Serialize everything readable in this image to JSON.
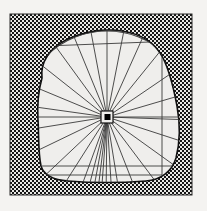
{
  "figure": {
    "title": "Radial survey plan of an irregular excavation area",
    "type": "archaeological-plan-diagram",
    "style": "line-drawing",
    "colors": {
      "page_background": "#f4f3f1",
      "interior_fill": "#efeeec",
      "hatch_ink": "#1a1a1a",
      "hatch_background": "#e8e7e4",
      "line_ink": "#3a3a3a",
      "outline_ink": "#111111",
      "hub_fill": "#000000"
    },
    "frame": {
      "outer_hatch_band": {
        "x": 10,
        "y": 14,
        "width": 182,
        "height": 181
      },
      "inner_rectangle": {
        "x": 21,
        "y": 30,
        "width": 141,
        "height": 145
      },
      "hatch_band_thickness": 12
    },
    "hub": {
      "label": "survey-station",
      "cx": 107,
      "cy": 117,
      "outer_square_size": 11,
      "inner_square_size": 6
    },
    "arc": {
      "label": "reference-arc",
      "radius": 86,
      "start_angle_deg": 182,
      "end_angle_deg": 358
    },
    "radial_lines_count": 24,
    "horizontal_chords_count": 3,
    "bottom_fan_count": 8,
    "blob": {
      "label": "excavation-outline",
      "description": "irregular closed contour enclosing the light interior"
    }
  }
}
